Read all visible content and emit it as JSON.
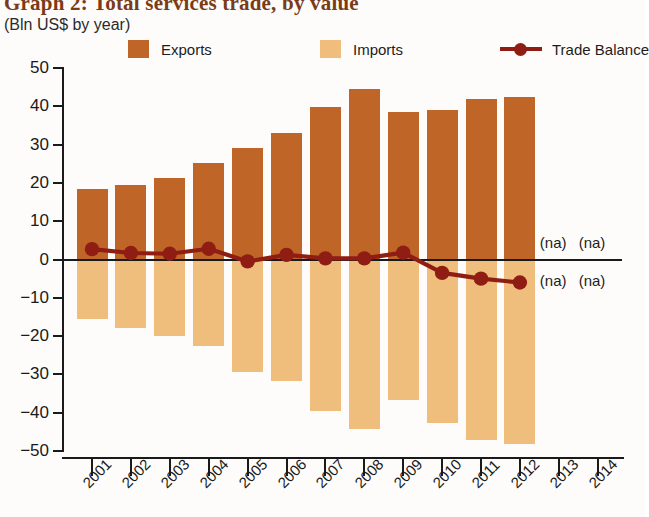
{
  "header": {
    "title": "Graph 2: Total services trade, by value",
    "subtitle": "(Bln US$ by year)"
  },
  "legend": {
    "exports_label": "Exports",
    "imports_label": "Imports",
    "balance_label": "Trade Balance"
  },
  "colors": {
    "exports": "#bf6527",
    "imports": "#efbe7d",
    "balance": "#8f1d14",
    "axis": "#1a1a1a",
    "title": "#7a3b16"
  },
  "annotations": {
    "na": "(na)"
  },
  "chart_data": {
    "type": "bar",
    "title": "Graph 2: Total services trade, by value",
    "subtitle": "(Bln US$ by year)",
    "xlabel": "",
    "ylabel": "Bln US$ by year",
    "ylim": [
      -50,
      50
    ],
    "ytick_values": [
      50,
      40,
      30,
      20,
      10,
      0,
      -10,
      -20,
      -30,
      -40,
      -50
    ],
    "ytick_labels": [
      "50",
      "40",
      "30",
      "20",
      "10",
      "0",
      "-10",
      "-20",
      "-30",
      "-40",
      "-50"
    ],
    "categories": [
      "2001",
      "2002",
      "2003",
      "2004",
      "2005",
      "2006",
      "2007",
      "2008",
      "2009",
      "2010",
      "2011",
      "2012",
      "2013",
      "2014"
    ],
    "grid": false,
    "legend_position": "top",
    "series": [
      {
        "name": "Exports",
        "type": "bar",
        "color": "#bf6527",
        "values": [
          18.3,
          19.5,
          21.4,
          25.3,
          29.0,
          33.0,
          39.9,
          44.5,
          38.4,
          39.1,
          42.0,
          42.3,
          null,
          null
        ]
      },
      {
        "name": "Imports",
        "type": "bar",
        "color": "#efbe7d",
        "values": [
          -15.6,
          -17.8,
          -19.9,
          -22.5,
          -29.5,
          -31.8,
          -39.6,
          -44.2,
          -36.6,
          -42.6,
          -47.0,
          -48.3,
          null,
          null
        ]
      },
      {
        "name": "Trade Balance",
        "type": "line",
        "color": "#8f1d14",
        "values": [
          2.7,
          1.7,
          1.5,
          2.8,
          -0.5,
          1.2,
          0.3,
          0.3,
          1.8,
          -3.5,
          -5.0,
          -6.0,
          null,
          null
        ]
      }
    ],
    "notes": [
      "2013 and 2014 data not available (na)"
    ]
  }
}
